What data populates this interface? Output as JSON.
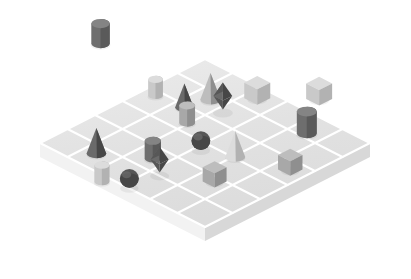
{
  "scene": {
    "title": "Isometric 3D Shape Grid Scene",
    "background_color": "#ffffff",
    "projection": "isometric",
    "board": {
      "name": "grid-board",
      "rows": 6,
      "cols": 6,
      "top_color": "#e3e3e3",
      "grid_line_color": "#ffffff",
      "left_side_color": "#f2f2f2",
      "right_side_color": "#d8d8d8",
      "thickness_px": 14,
      "center_x": 205,
      "center_y": 143,
      "cell_half_width": 27.5,
      "cell_half_height": 14.0
    },
    "palette": {
      "light_gray": "#c9c9c9",
      "light_gray_top": "#dcdcdc",
      "light_gray_dark": "#b2b2b2",
      "mid_gray": "#a8a8a8",
      "mid_gray_top": "#bdbdbd",
      "mid_gray_dark": "#8f8f8f",
      "dark_gray": "#6e6e6e",
      "dark_gray_top": "#848484",
      "dark_gray_darker": "#5a5a5a",
      "darkest_gray": "#575757",
      "darkest_gray_top": "#6a6a6a",
      "darkest_gray_dark": "#474747"
    },
    "objects": [
      {
        "id": 1,
        "name": "cube-top",
        "shape": "cube",
        "tone": "light",
        "col": 3.0,
        "row": -1.15,
        "size": 1.0
      },
      {
        "id": 2,
        "name": "cube-upper-left",
        "shape": "cube",
        "tone": "light",
        "col": 1.85,
        "row": -0.05,
        "size": 1.0
      },
      {
        "id": 3,
        "name": "cylinder-top-right",
        "shape": "cylinder",
        "tone": "dark",
        "col": 4.0,
        "row": 0.3,
        "size": 1.08
      },
      {
        "id": 4,
        "name": "cone-upper-gray",
        "shape": "cone",
        "tone": "mid",
        "col": 1.05,
        "row": 0.85,
        "size": 1.02
      },
      {
        "id": 5,
        "name": "octahedron-upper",
        "shape": "octahedron",
        "tone": "darkest",
        "col": 1.7,
        "row": 1.05,
        "size": 1.0
      },
      {
        "id": 6,
        "name": "cone-upper-dark",
        "shape": "cone",
        "tone": "darkest",
        "col": 0.85,
        "row": 1.6,
        "size": 0.92
      },
      {
        "id": 7,
        "name": "cylinder-left-light",
        "shape": "cylinder",
        "tone": "light",
        "col": -0.1,
        "row": 1.7,
        "size": 0.8
      },
      {
        "id": 8,
        "name": "cylinder-center-mid",
        "shape": "cylinder",
        "tone": "mid",
        "col": 1.45,
        "row": 2.1,
        "size": 0.86
      },
      {
        "id": 9,
        "name": "cylinder-far-left",
        "shape": "cylinder",
        "tone": "dark",
        "col": -2.95,
        "row": 0.85,
        "size": 1.0
      },
      {
        "id": 10,
        "name": "cone-center-light",
        "shape": "cone",
        "tone": "light",
        "col": 3.55,
        "row": 2.45,
        "size": 1.0
      },
      {
        "id": 11,
        "name": "sphere-center-dark",
        "shape": "sphere",
        "tone": "darkest",
        "col": 2.65,
        "row": 2.8,
        "size": 0.92
      },
      {
        "id": 12,
        "name": "cube-right",
        "shape": "cube",
        "tone": "mid",
        "col": 5.0,
        "row": 1.9,
        "size": 0.94
      },
      {
        "id": 13,
        "name": "cube-mid-right",
        "shape": "cube",
        "tone": "mid",
        "col": 4.05,
        "row": 3.7,
        "size": 0.92
      },
      {
        "id": 14,
        "name": "cylinder-lower-mid",
        "shape": "cylinder",
        "tone": "dark",
        "col": 2.1,
        "row": 4.0,
        "size": 0.88
      },
      {
        "id": 15,
        "name": "octahedron-lower",
        "shape": "octahedron",
        "tone": "darkest",
        "col": 2.8,
        "row": 4.45,
        "size": 0.96
      },
      {
        "id": 16,
        "name": "cone-lower-dark",
        "shape": "cone",
        "tone": "darkest",
        "col": 0.9,
        "row": 4.85,
        "size": 0.98
      },
      {
        "id": 17,
        "name": "sphere-lower-dark",
        "shape": "sphere",
        "tone": "darkest",
        "col": 2.7,
        "row": 5.45,
        "size": 0.92
      },
      {
        "id": 18,
        "name": "cylinder-bottom-light",
        "shape": "cylinder",
        "tone": "light",
        "col": 2.0,
        "row": 5.75,
        "size": 0.82
      }
    ],
    "object_count": 18,
    "counts_by_shape": {
      "cube": 4,
      "cylinder": 6,
      "cone": 4,
      "octahedron": 2,
      "sphere": 2
    }
  }
}
